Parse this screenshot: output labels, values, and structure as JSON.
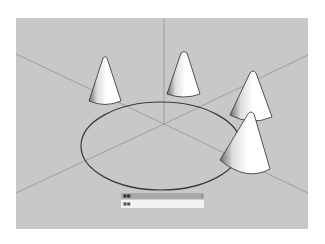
{
  "viewport": {
    "background": "#c8c8c8",
    "axis_color": "#8c8c8c",
    "circle_color": "#3a3a3a",
    "cones": [
      {
        "name": "cone-left",
        "cx": 89,
        "base_y": 83,
        "apex_y": 40,
        "half_width": 16
      },
      {
        "name": "cone-top-center",
        "cx": 168,
        "base_y": 76,
        "apex_y": 34,
        "half_width": 16
      },
      {
        "name": "cone-right-back",
        "cx": 237,
        "base_y": 98,
        "apex_y": 53,
        "half_width": 19
      },
      {
        "name": "cone-right-front",
        "cx": 235,
        "base_y": 156,
        "apex_y": 93,
        "half_width": 25
      }
    ]
  },
  "vcb": {
    "label": "■■",
    "close": "x",
    "value": "■■"
  }
}
